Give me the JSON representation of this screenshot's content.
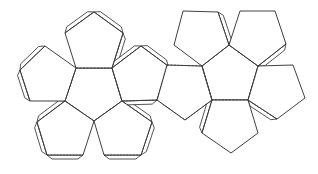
{
  "figure": {
    "line_color": "#2a2a2a",
    "background": "#ffffff",
    "fold_style": "dashed",
    "cut_style": "solid"
  },
  "left_cluster": {
    "center": [
      [
        76,
        68
      ],
      [
        112,
        68
      ],
      [
        122,
        101
      ],
      [
        94,
        121
      ],
      [
        65,
        101
      ]
    ],
    "faces": [
      {
        "name": "top",
        "points": [
          [
            76,
            68
          ],
          [
            65,
            33
          ],
          [
            94,
            12
          ],
          [
            123,
            33
          ],
          [
            112,
            68
          ]
        ],
        "tabbed_edges": [
          [
            1,
            2
          ],
          [
            2,
            3
          ],
          [
            3,
            4
          ]
        ]
      },
      {
        "name": "left",
        "points": [
          [
            76,
            68
          ],
          [
            45,
            46
          ],
          [
            20,
            70
          ],
          [
            30,
            101
          ],
          [
            65,
            101
          ]
        ],
        "tabbed_edges": [
          [
            1,
            2
          ],
          [
            2,
            3
          ]
        ]
      },
      {
        "name": "bottom-left",
        "points": [
          [
            65,
            101
          ],
          [
            37,
            122
          ],
          [
            47,
            155
          ],
          [
            83,
            155
          ],
          [
            94,
            121
          ]
        ],
        "tabbed_edges": [
          [
            0,
            1
          ],
          [
            1,
            2
          ],
          [
            2,
            3
          ]
        ]
      },
      {
        "name": "bottom-right",
        "points": [
          [
            94,
            121
          ],
          [
            104,
            155
          ],
          [
            141,
            155
          ],
          [
            152,
            122
          ],
          [
            122,
            101
          ]
        ],
        "tabbed_edges": [
          [
            1,
            2
          ],
          [
            2,
            3
          ],
          [
            3,
            4
          ]
        ]
      },
      {
        "name": "right",
        "points": [
          [
            112,
            68
          ],
          [
            141,
            46
          ],
          [
            168,
            66
          ],
          [
            157,
            100
          ],
          [
            122,
            101
          ]
        ],
        "tabbed_edges": [
          [
            0,
            1
          ],
          [
            1,
            2
          ],
          [
            3,
            4
          ]
        ]
      }
    ]
  },
  "right_cluster": {
    "center": [
      [
        202,
        66
      ],
      [
        229,
        45
      ],
      [
        258,
        66
      ],
      [
        248,
        100
      ],
      [
        212,
        100
      ]
    ],
    "faces": [
      {
        "name": "connector",
        "points": [
          [
            167,
            65
          ],
          [
            202,
            66
          ],
          [
            212,
            100
          ],
          [
            185,
            120
          ],
          [
            157,
            100
          ]
        ],
        "tabbed_edges": []
      },
      {
        "name": "upper-left",
        "points": [
          [
            202,
            66
          ],
          [
            174,
            45
          ],
          [
            183,
            11
          ],
          [
            218,
            12
          ],
          [
            229,
            45
          ]
        ],
        "tabbed_edges": [
          [
            3,
            4
          ]
        ]
      },
      {
        "name": "upper-right",
        "points": [
          [
            229,
            45
          ],
          [
            240,
            11
          ],
          [
            275,
            11
          ],
          [
            286,
            44
          ],
          [
            258,
            66
          ]
        ],
        "tabbed_edges": [
          [
            3,
            4
          ]
        ]
      },
      {
        "name": "right",
        "points": [
          [
            258,
            66
          ],
          [
            293,
            65
          ],
          [
            305,
            98
          ],
          [
            277,
            119
          ],
          [
            248,
            100
          ]
        ],
        "tabbed_edges": [
          [
            3,
            4
          ]
        ]
      },
      {
        "name": "bottom",
        "points": [
          [
            248,
            100
          ],
          [
            258,
            133
          ],
          [
            231,
            153
          ],
          [
            202,
            133
          ],
          [
            212,
            100
          ]
        ],
        "tabbed_edges": [
          [
            3,
            4
          ]
        ]
      }
    ]
  }
}
